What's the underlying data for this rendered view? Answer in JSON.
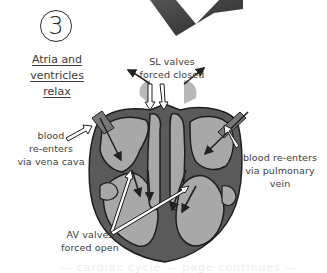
{
  "step": {
    "number": "3"
  },
  "title": {
    "lines": [
      "Atria and",
      "ventricles",
      "relax"
    ]
  },
  "labels": {
    "sl_valves": [
      "SL valves",
      "forced closed"
    ],
    "vena_cava": [
      "blood",
      "re-enters",
      "via vena cava"
    ],
    "pulmonary_vein": [
      "blood re-enters",
      "via pulmonary",
      "vein"
    ],
    "av_valves": [
      "AV valves",
      "forced open"
    ]
  },
  "colors": {
    "heart_wall": "#5a5a5a",
    "chamber_fill": "#a8a8a8",
    "outline": "#1e1e1e",
    "arrow_dark": "#2e2e2e",
    "arrow_open": "#ffffff",
    "big_arrow": "#3a3a3a"
  },
  "ghost_text": "— cardiac cycle — page continues —"
}
